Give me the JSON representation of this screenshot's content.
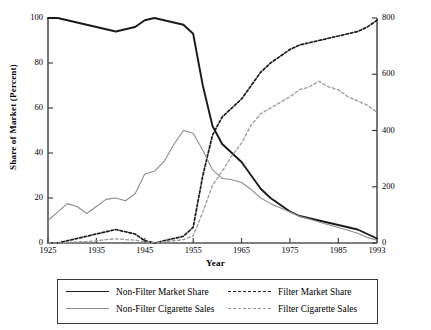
{
  "chart_data": {
    "type": "line",
    "title": "",
    "xlabel": "Year",
    "ylabel": "Share of Market (Percent)",
    "ylabel_right": "Cigarette Sales (Billions)",
    "xlim": [
      1925,
      1993
    ],
    "ylim": [
      0,
      100
    ],
    "ylim_right": [
      0,
      800
    ],
    "grid": false,
    "legend_position": "bottom",
    "xticks": [
      "1925",
      "1935",
      "1945",
      "1955",
      "1965",
      "1975",
      "1985",
      "1993"
    ],
    "xtick_values": [
      1925,
      1935,
      1945,
      1955,
      1965,
      1975,
      1985,
      1993
    ],
    "yticks_left": [
      "0",
      "20",
      "40",
      "60",
      "80",
      "100"
    ],
    "ytick_values_left": [
      0,
      20,
      40,
      60,
      80,
      100
    ],
    "yticks_right": [
      "0",
      "200",
      "400",
      "600",
      "800"
    ],
    "ytick_values_right": [
      0,
      200,
      400,
      600,
      800
    ],
    "series": [
      {
        "name": "Non-Filter Market Share",
        "axis": "left",
        "units": "percent",
        "style": "solid",
        "color": "#1a1a1a",
        "width": 1.9,
        "x": [
          1925,
          1927,
          1929,
          1931,
          1933,
          1935,
          1937,
          1939,
          1941,
          1943,
          1945,
          1947,
          1949,
          1951,
          1953,
          1955,
          1957,
          1959,
          1961,
          1963,
          1965,
          1967,
          1969,
          1971,
          1973,
          1975,
          1977,
          1979,
          1981,
          1983,
          1985,
          1987,
          1989,
          1991,
          1993
        ],
        "y": [
          100,
          100,
          99,
          98,
          97,
          96,
          95,
          94,
          95,
          96,
          99,
          100,
          99,
          98,
          97,
          93,
          70,
          52,
          44,
          40,
          36,
          30,
          24,
          20,
          17,
          14,
          12,
          11,
          10,
          9,
          8,
          7,
          6,
          4,
          2
        ]
      },
      {
        "name": "Filter Market Share",
        "axis": "left",
        "units": "percent",
        "style": "dashed",
        "color": "#1a1a1a",
        "width": 1.7,
        "x": [
          1925,
          1927,
          1929,
          1931,
          1933,
          1935,
          1937,
          1939,
          1941,
          1943,
          1945,
          1947,
          1949,
          1951,
          1953,
          1955,
          1957,
          1959,
          1961,
          1963,
          1965,
          1967,
          1969,
          1971,
          1973,
          1975,
          1977,
          1979,
          1981,
          1983,
          1985,
          1987,
          1989,
          1991,
          1993
        ],
        "y": [
          0,
          0,
          1,
          2,
          3,
          4,
          5,
          6,
          5,
          4,
          1,
          0,
          1,
          2,
          3,
          7,
          30,
          48,
          56,
          60,
          64,
          70,
          76,
          80,
          83,
          86,
          88,
          89,
          90,
          91,
          92,
          93,
          94,
          96,
          99
        ]
      },
      {
        "name": "Non-Filter Cigarette Sales",
        "axis": "right",
        "units": "billions",
        "style": "solid",
        "color": "#8c8c8c",
        "width": 1.1,
        "x": [
          1925,
          1927,
          1929,
          1931,
          1933,
          1935,
          1937,
          1939,
          1941,
          1943,
          1945,
          1947,
          1949,
          1951,
          1953,
          1955,
          1957,
          1959,
          1961,
          1963,
          1965,
          1967,
          1969,
          1971,
          1973,
          1975,
          1977,
          1979,
          1981,
          1983,
          1985,
          1987,
          1989,
          1991,
          1993
        ],
        "y": [
          80,
          110,
          140,
          130,
          105,
          130,
          155,
          160,
          150,
          175,
          245,
          255,
          290,
          350,
          400,
          390,
          330,
          260,
          230,
          225,
          215,
          190,
          160,
          140,
          125,
          110,
          95,
          85,
          75,
          65,
          55,
          45,
          35,
          20,
          10
        ]
      },
      {
        "name": "Filter Cigarette Sales",
        "axis": "right",
        "units": "billions",
        "style": "dashed",
        "color": "#9a9a9a",
        "width": 1.3,
        "x": [
          1925,
          1927,
          1929,
          1931,
          1933,
          1935,
          1937,
          1939,
          1941,
          1943,
          1945,
          1947,
          1949,
          1951,
          1953,
          1955,
          1957,
          1959,
          1961,
          1963,
          1965,
          1967,
          1969,
          1971,
          1973,
          1975,
          1977,
          1979,
          1981,
          1983,
          1985,
          1987,
          1989,
          1991,
          1993
        ],
        "y": [
          0,
          0,
          2,
          4,
          5,
          8,
          12,
          15,
          12,
          10,
          3,
          2,
          4,
          8,
          12,
          25,
          110,
          205,
          255,
          310,
          355,
          420,
          460,
          480,
          500,
          520,
          545,
          555,
          575,
          555,
          545,
          520,
          505,
          490,
          465
        ]
      }
    ],
    "annotations": []
  },
  "axes": {
    "left_title": "Share of Market (Percent)",
    "right_title": "Cigarette Sales (Billions)",
    "x_title": "Year"
  },
  "legend": {
    "entries": [
      {
        "label": "Non-Filter Market Share",
        "swatch": "solid-black-line-icon"
      },
      {
        "label": "Filter Market Share",
        "swatch": "dashed-black-line-icon"
      },
      {
        "label": "Non-Filter Cigarette Sales",
        "swatch": "solid-gray-line-icon"
      },
      {
        "label": "Filter Cigarette Sales",
        "swatch": "dashed-gray-line-icon"
      }
    ]
  }
}
